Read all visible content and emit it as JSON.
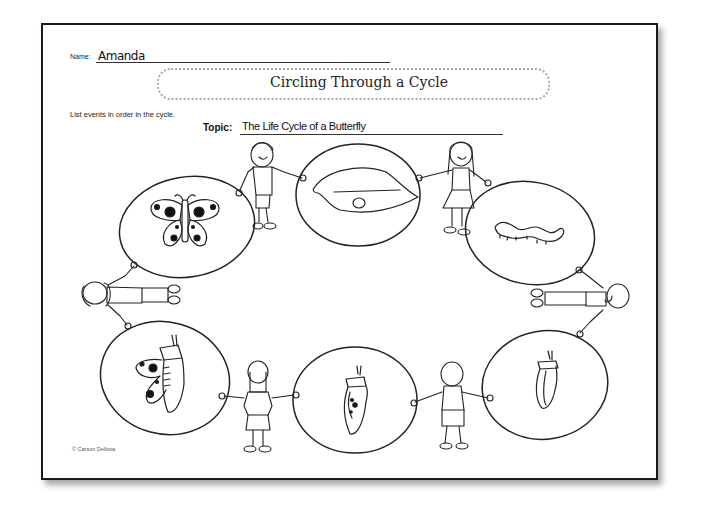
{
  "worksheet": {
    "name_label": "Name:",
    "name_value": "Amanda",
    "title": "Circling Through a Cycle",
    "instructions": "List events in order in the cycle.",
    "topic_label": "Topic:",
    "topic_value": "The Life Cycle of a Butterfly",
    "copyright": "© Carson Dellosa"
  },
  "cycle_stages": [
    {
      "position": "top-center",
      "picture": "egg-on-leaf-icon"
    },
    {
      "position": "top-right",
      "picture": "caterpillar-icon"
    },
    {
      "position": "bottom-right",
      "picture": "chrysalis-icon"
    },
    {
      "position": "bottom-center",
      "picture": "chrysalis-developing-icon"
    },
    {
      "position": "bottom-left",
      "picture": "butterfly-emerging-icon"
    },
    {
      "position": "top-left",
      "picture": "butterfly-icon"
    }
  ],
  "children": [
    {
      "position": "top-left-between",
      "figure": "boy-icon"
    },
    {
      "position": "top-right-between",
      "figure": "girl-icon"
    },
    {
      "position": "right",
      "figure": "boy-sideways-icon"
    },
    {
      "position": "bottom-right-between",
      "figure": "boy-back-icon"
    },
    {
      "position": "bottom-left-between",
      "figure": "girl-back-icon"
    },
    {
      "position": "left",
      "figure": "girl-sideways-icon"
    }
  ]
}
